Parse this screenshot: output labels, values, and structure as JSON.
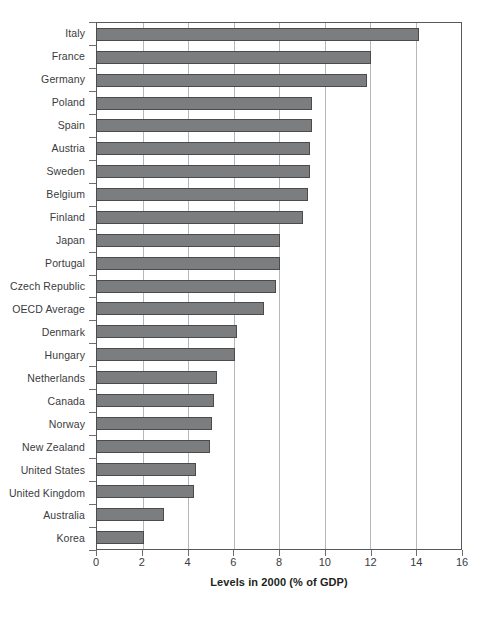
{
  "chart_data": {
    "type": "bar",
    "orientation": "horizontal",
    "title": "",
    "xlabel": "Levels in 2000 (% of GDP)",
    "ylabel": "",
    "xlim": [
      0,
      16
    ],
    "xticks": [
      0,
      2,
      4,
      6,
      8,
      10,
      12,
      14,
      16
    ],
    "xtick_labels": [
      "0",
      "2",
      "4",
      "6",
      "8",
      "10",
      "12",
      "14",
      "16"
    ],
    "grid": "vertical",
    "legend": "none",
    "bar_color": "#7c7d7f",
    "bar_edge_color": "#4a4b4d",
    "categories": [
      "Italy",
      "France",
      "Germany",
      "Poland",
      "Spain",
      "Austria",
      "Sweden",
      "Belgium",
      "Finland",
      "Japan",
      "Portugal",
      "Czech Republic",
      "OECD Average",
      "Denmark",
      "Hungary",
      "Netherlands",
      "Canada",
      "Norway",
      "New Zealand",
      "United States",
      "United Kingdom",
      "Australia",
      "Korea"
    ],
    "values": [
      14.2,
      12.1,
      11.9,
      9.5,
      9.5,
      9.4,
      9.4,
      9.3,
      9.1,
      8.1,
      8.1,
      7.9,
      7.4,
      6.2,
      6.1,
      5.3,
      5.2,
      5.1,
      5.0,
      4.4,
      4.3,
      3.0,
      2.1
    ]
  },
  "caption": ""
}
